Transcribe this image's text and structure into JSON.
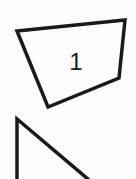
{
  "diagram": {
    "shapes": [
      {
        "type": "quadrilateral",
        "label": "1",
        "points": "17,31 125,20 119,78 48,107"
      },
      {
        "type": "triangle",
        "label": "",
        "points": "17,119 17,185 95,185"
      }
    ],
    "stroke_color": "#1a1a1a",
    "background": "#fdfdfd"
  }
}
